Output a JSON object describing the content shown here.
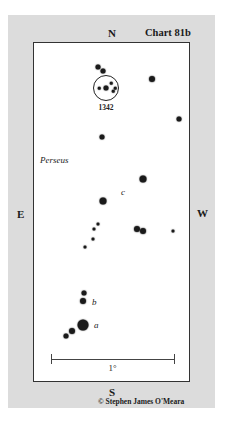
{
  "chart": {
    "title": "Chart 81b",
    "credit": "© Stephen James O'Meara",
    "directions": {
      "north": "N",
      "south": "S",
      "east": "E",
      "west": "W"
    },
    "constellation_label": "Perseus",
    "cluster": {
      "label": "1342",
      "cx": 106,
      "cy": 88,
      "r": 12
    },
    "scale": {
      "label": "1°",
      "x1": 51,
      "x2": 174,
      "y": 359
    },
    "star_labels": [
      {
        "text": "c",
        "x": 121,
        "y": 188
      },
      {
        "text": "b",
        "x": 92,
        "y": 298
      },
      {
        "text": "a",
        "x": 94,
        "y": 321
      }
    ],
    "stars": [
      {
        "x": 98,
        "y": 67,
        "d": 5
      },
      {
        "x": 103,
        "y": 71,
        "d": 5
      },
      {
        "x": 106,
        "y": 88,
        "d": 5
      },
      {
        "x": 99,
        "y": 88,
        "d": 2.5
      },
      {
        "x": 111,
        "y": 83,
        "d": 2.5
      },
      {
        "x": 115,
        "y": 88,
        "d": 2.5
      },
      {
        "x": 113,
        "y": 91,
        "d": 2.5
      },
      {
        "x": 152,
        "y": 79,
        "d": 6
      },
      {
        "x": 179,
        "y": 119,
        "d": 5
      },
      {
        "x": 102,
        "y": 137,
        "d": 5
      },
      {
        "x": 143,
        "y": 179,
        "d": 7
      },
      {
        "x": 103,
        "y": 201,
        "d": 7
      },
      {
        "x": 98,
        "y": 224,
        "d": 3
      },
      {
        "x": 94,
        "y": 229,
        "d": 3
      },
      {
        "x": 93,
        "y": 239,
        "d": 3
      },
      {
        "x": 85,
        "y": 247,
        "d": 3
      },
      {
        "x": 137,
        "y": 229,
        "d": 6
      },
      {
        "x": 143,
        "y": 231,
        "d": 6
      },
      {
        "x": 173,
        "y": 231,
        "d": 3
      },
      {
        "x": 84,
        "y": 293,
        "d": 5
      },
      {
        "x": 83,
        "y": 301,
        "d": 6
      },
      {
        "x": 83,
        "y": 325,
        "d": 11
      },
      {
        "x": 72,
        "y": 331,
        "d": 6
      },
      {
        "x": 66,
        "y": 336,
        "d": 5
      }
    ]
  }
}
